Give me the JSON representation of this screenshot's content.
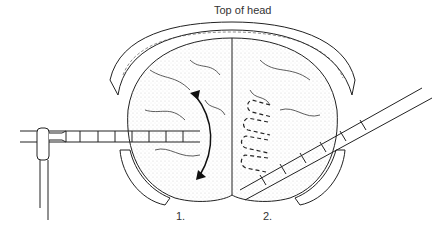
{
  "title": "Top of head",
  "labels": {
    "position_1": "1.",
    "position_2": "2."
  },
  "elements": {
    "left_probe": "straight probe with marked shaft, horizontal, left hemisphere",
    "right_probe": "angled probe inserted diagonally from lower right",
    "arrow": "curved double-headed arrow indicating sweep motion",
    "dashed_paths": "dashed zig-zag paths in right hemisphere"
  }
}
